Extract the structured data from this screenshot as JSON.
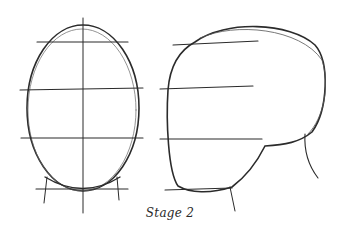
{
  "figure": {
    "caption": "Stage 2",
    "panels": [
      {
        "id": "front-view",
        "description": "Front view head oval with guide lines"
      },
      {
        "id": "side-view",
        "description": "Side view head shape with guide lines"
      }
    ],
    "stroke_color": "#2b2b2b"
  }
}
